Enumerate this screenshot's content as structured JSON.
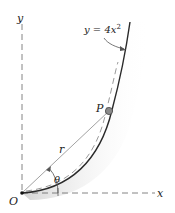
{
  "diagram": {
    "equation_label": "y = 4x",
    "equation_exponent": "2",
    "axis_x_label": "x",
    "axis_y_label": "y",
    "origin_label": "O",
    "point_label": "P",
    "radius_label": "r",
    "angle_label": "θ",
    "colors": {
      "curve": "#2a2a2a",
      "axis": "#666666",
      "dashed_path": "#9a9a9a",
      "point_fill": "#8a8a8a",
      "shading": "#bdbdbd"
    }
  }
}
